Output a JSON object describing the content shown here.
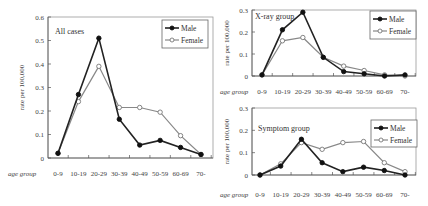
{
  "chart_data": [
    {
      "type": "line",
      "title": "All cases",
      "xlabel": "age group",
      "ylabel": "rate per 100,000",
      "categories": [
        "0-9",
        "10-19",
        "20-29",
        "30-39",
        "40-49",
        "50-59",
        "60-69",
        "70-"
      ],
      "ylim": [
        0,
        0.6
      ],
      "yticks": [
        "0",
        "0.1",
        "0.2",
        "0.3",
        "0.4",
        "0.5",
        "0.6"
      ],
      "grid": false,
      "legend_position": "upper right",
      "series": [
        {
          "name": "Male",
          "marker": "filled-circle",
          "color": "#222222",
          "values": [
            0.02,
            0.27,
            0.51,
            0.165,
            0.055,
            0.075,
            0.045,
            0.015
          ]
        },
        {
          "name": "Female",
          "marker": "open-circle",
          "color": "#888888",
          "values": [
            0.02,
            0.24,
            0.39,
            0.215,
            0.215,
            0.195,
            0.095,
            0.015
          ]
        }
      ]
    },
    {
      "type": "line",
      "title": "X-ray group",
      "xlabel": "age group",
      "ylabel": "rate per 100,000",
      "categories": [
        "0-9",
        "10-19",
        "20-29",
        "30-39",
        "40-49",
        "50-59",
        "60-69",
        "70-"
      ],
      "ylim": [
        0,
        0.3
      ],
      "yticks": [
        "0",
        "0.1",
        "0.2",
        "0.3"
      ],
      "grid": false,
      "legend_position": "upper right",
      "series": [
        {
          "name": "Male",
          "marker": "filled-circle",
          "color": "#222222",
          "values": [
            0.005,
            0.21,
            0.29,
            0.085,
            0.02,
            0.01,
            0.0,
            0.005
          ]
        },
        {
          "name": "Female",
          "marker": "open-circle",
          "color": "#888888",
          "values": [
            0.005,
            0.16,
            0.175,
            0.085,
            0.045,
            0.025,
            0.005,
            0.0
          ]
        }
      ]
    },
    {
      "type": "line",
      "title": "Symptom group",
      "xlabel": "age group",
      "ylabel": "rate per 100,000",
      "categories": [
        "0-9",
        "10-19",
        "20-29",
        "30-39",
        "40-49",
        "50-59",
        "60-69",
        "70-"
      ],
      "ylim": [
        0,
        0.3
      ],
      "yticks": [
        "0",
        "0.1",
        "0.2",
        "0.3"
      ],
      "grid": false,
      "legend_position": "upper right",
      "series": [
        {
          "name": "Male",
          "marker": "filled-circle",
          "color": "#222222",
          "values": [
            0.0,
            0.04,
            0.16,
            0.055,
            0.015,
            0.035,
            0.02,
            0.0
          ]
        },
        {
          "name": "Female",
          "marker": "open-circle",
          "color": "#888888",
          "values": [
            0.0,
            0.05,
            0.145,
            0.115,
            0.145,
            0.15,
            0.055,
            0.015
          ]
        }
      ]
    }
  ],
  "layout": [
    {
      "x0": 48,
      "x1": 213,
      "ytop": 17,
      "ybot": 158,
      "px0": 58,
      "px1": 201,
      "title_xy": [
        55,
        34
      ],
      "legend": [
        162,
        20,
        46,
        28
      ],
      "xlab_y": 176,
      "age_x": 8,
      "ylabel_x": 24
    },
    {
      "x0": 252,
      "x1": 416,
      "ytop": 10,
      "ybot": 76,
      "px0": 262,
      "px1": 405,
      "title_xy": [
        255,
        19
      ],
      "legend": [
        370,
        11,
        46,
        28
      ],
      "xlab_y": 94,
      "age_x": 220,
      "ylabel_x": 229
    },
    {
      "x0": 252,
      "x1": 416,
      "ytop": 108,
      "ybot": 175,
      "px0": 260,
      "px1": 405,
      "title_xy": [
        258,
        131
      ],
      "legend": [
        371,
        120,
        46,
        27
      ],
      "xlab_y": 197,
      "age_x": 220,
      "ylabel_x": 229
    }
  ]
}
